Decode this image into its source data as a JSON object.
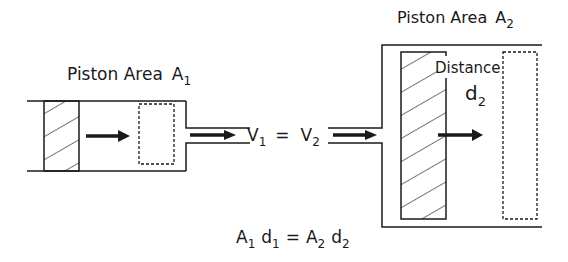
{
  "left_cylinder": {
    "label": "Piston Area",
    "symbol": "A",
    "subscript": "1"
  },
  "right_cylinder": {
    "label": "Piston Area",
    "symbol": "A",
    "subscript": "2",
    "distance_label": "Distance",
    "distance_symbol": "d",
    "distance_subscript": "2"
  },
  "velocity_equation": {
    "v1": "V",
    "v1_sub": "1",
    "equals": "=",
    "v2": "V",
    "v2_sub": "2"
  },
  "area_equation": {
    "a1": "A",
    "a1_sub": "1",
    "d1": "d",
    "d1_sub": "1",
    "equals": "=",
    "a2": "A",
    "a2_sub": "2",
    "d2": "d",
    "d2_sub": "2"
  },
  "colors": {
    "line": "#1a1a1a",
    "background": "#ffffff"
  }
}
